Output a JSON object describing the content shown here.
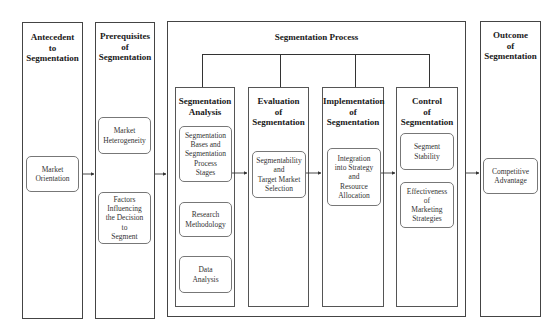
{
  "diagram": {
    "antecedent": {
      "title": "Antecedent\nto\nSegmentation",
      "items": [
        "Market\nOrientation"
      ]
    },
    "prerequisites": {
      "title": "Prerequisites\nof\nSegmentation",
      "items": [
        "Market\nHeterogeneity",
        "Factors\nInfluencing\nthe Decision\nto\nSegment"
      ]
    },
    "process": {
      "title": "Segmentation Process",
      "stages": [
        {
          "title": "Segmentation\nAnalysis",
          "items": [
            "Segmentation\nBases and\nSegmentation\nProcess\nStages",
            "Research\nMethodology",
            "Data\nAnalysis"
          ]
        },
        {
          "title": "Evaluation\nof\nSegmentation",
          "items": [
            "Segmentability\nand\nTarget Market\nSelection"
          ]
        },
        {
          "title": "Implementation\nof\nSegmentation",
          "items": [
            "Integration\ninto Strategy\nand\nResource\nAllocation"
          ]
        },
        {
          "title": "Control\nof\nSegmentation",
          "items": [
            "Segment\nStability",
            "Effectiveness\nof\nMarketing\nStrategies"
          ]
        }
      ]
    },
    "outcome": {
      "title": "Outcome\nof\nSegmentation",
      "items": [
        "Competitive\nAdvantage"
      ]
    },
    "colors": {
      "line": "#333333",
      "box_border": "#777777",
      "background": "#ffffff"
    }
  }
}
